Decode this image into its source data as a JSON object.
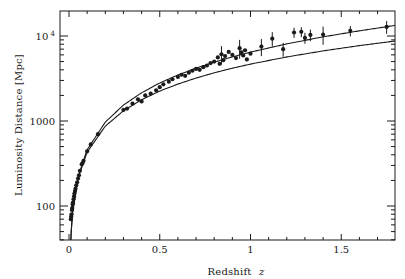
{
  "chart_data": {
    "type": "scatter",
    "title": "",
    "xlabel": "Redshift z",
    "xlabel_text": "Redshift",
    "xlabel_var": "z",
    "ylabel": "Luminosity Distance [Mpc]",
    "xlim": [
      -0.02,
      1.8
    ],
    "ylim": [
      40,
      17000
    ],
    "yscale": "log",
    "grid": false,
    "legend": null,
    "x_ticks": [
      {
        "value": 0,
        "label": "0"
      },
      {
        "value": 0.5,
        "label": "0.5"
      },
      {
        "value": 1,
        "label": "1"
      },
      {
        "value": 1.5,
        "label": "1.5"
      }
    ],
    "x_minor_step": 0.1,
    "y_ticks": [
      {
        "value": 100,
        "label": "100"
      },
      {
        "value": 1000,
        "label": "1000"
      },
      {
        "value": 10000,
        "label": "10 ⁴"
      }
    ],
    "series": [
      {
        "name": "Supernova data (with error bars)",
        "kind": "scatter",
        "points": [
          [
            0.01,
            70
          ],
          [
            0.012,
            75
          ],
          [
            0.014,
            80
          ],
          [
            0.016,
            90
          ],
          [
            0.018,
            95
          ],
          [
            0.02,
            105
          ],
          [
            0.022,
            110
          ],
          [
            0.025,
            120
          ],
          [
            0.028,
            130
          ],
          [
            0.03,
            140
          ],
          [
            0.033,
            150
          ],
          [
            0.036,
            160
          ],
          [
            0.04,
            175
          ],
          [
            0.045,
            190
          ],
          [
            0.05,
            210
          ],
          [
            0.055,
            230
          ],
          [
            0.06,
            260
          ],
          [
            0.07,
            310
          ],
          [
            0.075,
            320
          ],
          [
            0.08,
            340
          ],
          [
            0.1,
            440
          ],
          [
            0.12,
            530
          ],
          [
            0.16,
            700
          ],
          [
            0.3,
            1350
          ],
          [
            0.32,
            1400
          ],
          [
            0.35,
            1600
          ],
          [
            0.38,
            1800
          ],
          [
            0.4,
            1700
          ],
          [
            0.42,
            2000
          ],
          [
            0.45,
            2100
          ],
          [
            0.48,
            2300
          ],
          [
            0.5,
            2500
          ],
          [
            0.52,
            2700
          ],
          [
            0.55,
            2900
          ],
          [
            0.57,
            3100
          ],
          [
            0.6,
            3300
          ],
          [
            0.62,
            3500
          ],
          [
            0.64,
            3400
          ],
          [
            0.66,
            3700
          ],
          [
            0.68,
            3900
          ],
          [
            0.7,
            4100
          ],
          [
            0.72,
            4000
          ],
          [
            0.74,
            4300
          ],
          [
            0.76,
            4500
          ],
          [
            0.78,
            4800
          ],
          [
            0.8,
            5000
          ],
          [
            0.82,
            5600
          ],
          [
            0.83,
            4700
          ],
          [
            0.84,
            6100
          ],
          [
            0.85,
            5200
          ],
          [
            0.86,
            5800
          ],
          [
            0.88,
            6500
          ],
          [
            0.9,
            6000
          ],
          [
            0.92,
            5500
          ],
          [
            0.94,
            7200
          ],
          [
            0.95,
            6400
          ],
          [
            0.96,
            5900
          ],
          [
            0.97,
            6800
          ],
          [
            0.98,
            5300
          ],
          [
            1.0,
            6200
          ],
          [
            1.06,
            7500
          ],
          [
            1.12,
            9300
          ],
          [
            1.18,
            7000
          ],
          [
            1.24,
            11000
          ],
          [
            1.28,
            11200
          ],
          [
            1.3,
            9500
          ],
          [
            1.33,
            10300
          ],
          [
            1.4,
            10400
          ],
          [
            1.55,
            11500
          ],
          [
            1.75,
            12800
          ]
        ],
        "error_bars": [
          {
            "x": 0.84,
            "y": 6100,
            "err": 1500
          },
          {
            "x": 0.94,
            "y": 7200,
            "err": 1800
          },
          {
            "x": 1.06,
            "y": 7500,
            "err": 1700
          },
          {
            "x": 1.12,
            "y": 9300,
            "err": 1800
          },
          {
            "x": 1.18,
            "y": 7000,
            "err": 1300
          },
          {
            "x": 1.24,
            "y": 11000,
            "err": 1500
          },
          {
            "x": 1.28,
            "y": 11200,
            "err": 1500
          },
          {
            "x": 1.3,
            "y": 9500,
            "err": 1400
          },
          {
            "x": 1.33,
            "y": 10300,
            "err": 1600
          },
          {
            "x": 1.4,
            "y": 10400,
            "err": 2500
          },
          {
            "x": 1.55,
            "y": 11500,
            "err": 1600
          },
          {
            "x": 1.75,
            "y": 12800,
            "err": 2200
          }
        ]
      },
      {
        "name": "Model curve (upper, accelerating)",
        "kind": "line",
        "x": [
          0.005,
          0.01,
          0.02,
          0.05,
          0.1,
          0.2,
          0.3,
          0.4,
          0.5,
          0.6,
          0.7,
          0.8,
          0.9,
          1.0,
          1.2,
          1.4,
          1.6,
          1.8
        ],
        "y": [
          21.5,
          43,
          87,
          222,
          460,
          970,
          1540,
          2150,
          2800,
          3480,
          4190,
          4920,
          5680,
          6460,
          8080,
          9770,
          11500,
          13350
        ]
      },
      {
        "name": "Model curve (lower, matter-only)",
        "kind": "line",
        "x": [
          0.005,
          0.01,
          0.02,
          0.05,
          0.1,
          0.2,
          0.3,
          0.4,
          0.5,
          0.6,
          0.7,
          0.8,
          0.9,
          1.0,
          1.2,
          1.4,
          1.6,
          1.8
        ],
        "y": [
          21.4,
          42.7,
          85,
          213,
          430,
          870,
          1320,
          1780,
          2250,
          2720,
          3200,
          3690,
          4180,
          4670,
          5670,
          6680,
          7710,
          8740
        ]
      }
    ]
  }
}
